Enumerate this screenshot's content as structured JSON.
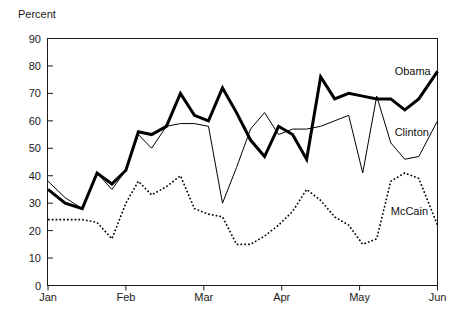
{
  "chart_data": {
    "type": "line",
    "title": "",
    "subtitle": "",
    "xlabel": "",
    "ylabel": "Percent",
    "ylim": [
      0,
      90
    ],
    "xlim": [
      0,
      5
    ],
    "grid": false,
    "legend_position": "inline-right",
    "y_ticks": [
      0,
      10,
      20,
      30,
      40,
      50,
      60,
      70,
      80,
      90
    ],
    "y_tick_labels": [
      "0",
      "10",
      "20",
      "30",
      "40",
      "50",
      "60",
      "70",
      "80",
      "90"
    ],
    "x_ticks": [
      0,
      1,
      2,
      3,
      4,
      5
    ],
    "x_tick_labels": [
      "Jan",
      "Feb",
      "Mar",
      "Apr",
      "May",
      "Jun"
    ],
    "annotations": [
      {
        "text": "Obama",
        "x": 4.45,
        "y": 78
      },
      {
        "text": "Clinton",
        "x": 4.45,
        "y": 56
      },
      {
        "text": "McCain",
        "x": 4.4,
        "y": 27
      }
    ],
    "series": [
      {
        "name": "Obama",
        "style": "thick-solid",
        "color": "#000000",
        "line_width": 3,
        "x": [
          0.0,
          0.22,
          0.44,
          0.63,
          0.82,
          1.0,
          1.16,
          1.33,
          1.52,
          1.7,
          1.88,
          2.06,
          2.24,
          2.42,
          2.6,
          2.78,
          2.96,
          3.14,
          3.32,
          3.5,
          3.68,
          3.86,
          4.04,
          4.22,
          4.4,
          4.58,
          4.76,
          5.0
        ],
        "values": [
          35,
          30,
          28,
          41,
          37,
          42,
          56,
          55,
          58,
          70,
          62,
          60,
          72,
          63,
          53,
          47,
          58,
          55,
          46,
          76,
          68,
          70,
          69,
          68,
          68,
          64,
          68,
          78
        ]
      },
      {
        "name": "Clinton",
        "style": "thin-solid",
        "color": "#000000",
        "line_width": 1,
        "x": [
          0.0,
          0.22,
          0.44,
          0.63,
          0.82,
          1.0,
          1.16,
          1.33,
          1.52,
          1.7,
          1.88,
          2.06,
          2.24,
          2.42,
          2.6,
          2.78,
          2.96,
          3.14,
          3.32,
          3.5,
          3.68,
          3.86,
          4.04,
          4.22,
          4.4,
          4.58,
          4.76,
          5.0
        ],
        "values": [
          38,
          32,
          28,
          41,
          35,
          42,
          55,
          50,
          58,
          59,
          59,
          58,
          30,
          43,
          57,
          63,
          55,
          57,
          57,
          58,
          60,
          62,
          41,
          69,
          52,
          46,
          47,
          60
        ]
      },
      {
        "name": "McCain",
        "style": "dotted",
        "color": "#000000",
        "line_width": 1.6,
        "x": [
          0.0,
          0.22,
          0.44,
          0.63,
          0.82,
          1.0,
          1.16,
          1.33,
          1.52,
          1.7,
          1.88,
          2.06,
          2.24,
          2.42,
          2.6,
          2.78,
          2.96,
          3.14,
          3.32,
          3.5,
          3.68,
          3.86,
          4.04,
          4.22,
          4.4,
          4.58,
          4.76,
          5.0
        ],
        "values": [
          24,
          24,
          24,
          23,
          17,
          30,
          38,
          33,
          36,
          40,
          28,
          26,
          25,
          15,
          15,
          18,
          22,
          27,
          35,
          31,
          25,
          22,
          15,
          17,
          38,
          41,
          39,
          22
        ]
      }
    ]
  },
  "axis": {
    "unit_label": "Percent"
  }
}
